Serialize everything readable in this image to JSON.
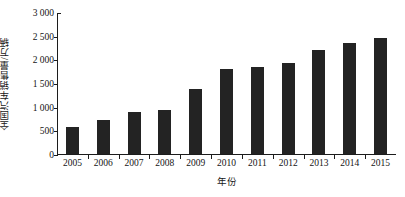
{
  "chart_data": {
    "type": "bar",
    "title": "",
    "subtitle": "",
    "xlabel": "年份",
    "ylabel": "全国汽车销售量/万辆",
    "categories": [
      "2005",
      "2006",
      "2007",
      "2008",
      "2009",
      "2010",
      "2011",
      "2012",
      "2013",
      "2014",
      "2015"
    ],
    "values": [
      580,
      720,
      880,
      935,
      1365,
      1800,
      1845,
      1920,
      2195,
      2350,
      2460
    ],
    "series": [
      {
        "name": "全国汽车销售量",
        "values": [
          580,
          720,
          880,
          935,
          1365,
          1800,
          1845,
          1920,
          2195,
          2350,
          2460
        ]
      }
    ],
    "ylim": [
      0,
      3000
    ],
    "ytick_values": [
      0,
      500,
      1000,
      1500,
      2000,
      2500,
      3000
    ],
    "ytick_labels": [
      "0",
      "500",
      "1 000",
      "1 500",
      "2 000",
      "2 500",
      "3 000"
    ],
    "xtick_labels": [
      "2005",
      "2006",
      "2007",
      "2008",
      "2009",
      "2010",
      "2011",
      "2012",
      "2013",
      "2014",
      "2015"
    ],
    "grid": false,
    "legend": null,
    "legend_position": "none",
    "bar_color": "#232323",
    "axis_color": "#1c1c1c",
    "background_color": "#ffffff",
    "annotations": []
  }
}
